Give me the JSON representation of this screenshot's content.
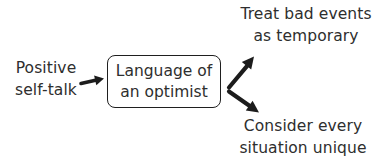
{
  "diagram": {
    "source": {
      "line1": "Positive",
      "line2": "self-talk"
    },
    "center": {
      "line1": "Language of",
      "line2": "an optimist"
    },
    "outcome_top": {
      "line1": "Treat bad events",
      "line2": "as temporary"
    },
    "outcome_bottom": {
      "line1": "Consider every",
      "line2": "situation unique"
    },
    "colors": {
      "text": "#2e2e2e",
      "arrow": "#1c1c1c",
      "box_border": "#1f1f1f",
      "background": "#ffffff"
    }
  }
}
